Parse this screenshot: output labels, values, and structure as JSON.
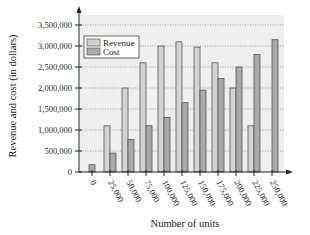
{
  "chart_data": {
    "type": "bar",
    "title": "",
    "xlabel": "Number of units",
    "ylabel": "Revenue and cost (in dollars)",
    "categories": [
      "0",
      "25,000",
      "50,000",
      "75,000",
      "100,000",
      "125,000",
      "150,000",
      "175,000",
      "200,000",
      "225,000",
      "250,000"
    ],
    "series": [
      {
        "name": "Revenue",
        "color": "#d2d2d2",
        "values": [
          0,
          1100000,
          2000000,
          2600000,
          3000000,
          3100000,
          2975000,
          2600000,
          2000000,
          1100000,
          0
        ]
      },
      {
        "name": "Cost",
        "color": "#a9a9a9",
        "values": [
          175000,
          450000,
          775000,
          1100000,
          1300000,
          1650000,
          1950000,
          2225000,
          2500000,
          2800000,
          3150000
        ]
      }
    ],
    "ylim": [
      0,
      3500000
    ],
    "yticks": [
      0,
      500000,
      1000000,
      1500000,
      2000000,
      2500000,
      3000000,
      3500000
    ],
    "ytick_labels": [
      "0",
      "500,000",
      "1,000,000",
      "1,500,000",
      "2,000,000",
      "2,500,000",
      "3,000,000",
      "3,500,000"
    ],
    "grid": true,
    "legend_position": "upper-left",
    "plot_background": "#efefef"
  }
}
